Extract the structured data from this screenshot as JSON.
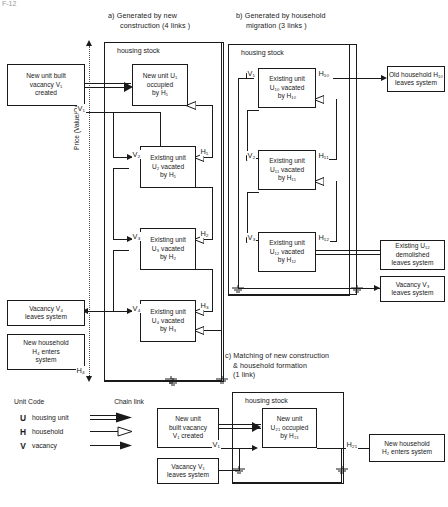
{
  "figure": {
    "corner_mark": "F-12",
    "axis_label": "Price (Value/Quality/ Scale )"
  },
  "panels": {
    "a": {
      "title_line1": "a) Generated by new",
      "title_line2": "construction (4 links )",
      "container_label": "housing stock",
      "boxes": [
        {
          "id": "a-new-unit-built",
          "lines": [
            "New unit built",
            "vacancy V₁",
            "created"
          ]
        },
        {
          "id": "a-u1",
          "lines": [
            "New unit U₁",
            "occupied",
            "by  H₁"
          ]
        },
        {
          "id": "a-u2",
          "lines": [
            "Existing unit",
            "U₂  vacated",
            "by   H₁"
          ]
        },
        {
          "id": "a-u3",
          "lines": [
            "Existing unit",
            "U₃ vacated",
            "by H₂"
          ]
        },
        {
          "id": "a-u4",
          "lines": [
            "Existing unit",
            "U₄ vacated",
            "by H₃"
          ]
        },
        {
          "id": "a-vacancy-leaves",
          "lines": [
            "Vacancy  V₄",
            "leaves  system"
          ]
        },
        {
          "id": "a-new-household",
          "lines": [
            "New household",
            "H₄ enters",
            "system"
          ]
        }
      ],
      "node_labels": [
        "V₁",
        "V₂",
        "V₃",
        "V₄",
        "H₁",
        "H₂",
        "H₃",
        "H₄"
      ]
    },
    "b": {
      "title_line1": "b) Generated by household",
      "title_line2": "migration (3 links )",
      "container_label": "housing stock",
      "boxes": [
        {
          "id": "b-u10",
          "lines": [
            "Existing unit",
            "U₁₀ vacated",
            "by  H₁₀"
          ]
        },
        {
          "id": "b-u11",
          "lines": [
            "Existing unit",
            "U₁₁ vacated",
            "by   H₁₁"
          ]
        },
        {
          "id": "b-u12",
          "lines": [
            "Existing unit",
            "U₁₂ vacated",
            "by H₁₂"
          ]
        },
        {
          "id": "b-old-household",
          "lines": [
            "Old household H₁₀",
            "leaves system"
          ]
        },
        {
          "id": "b-demolished",
          "lines": [
            "Existing   U₁₂",
            "demolished",
            "leaves system"
          ]
        },
        {
          "id": "b-vacancy-leaves",
          "lines": [
            "Vacancy V₃",
            "leaves system"
          ]
        }
      ],
      "node_labels": [
        "V₁",
        "V₂",
        "V₃",
        "H₁₀",
        "H₁₁",
        "H₁₂"
      ]
    },
    "c": {
      "title_line1": "c) Matching of new construction",
      "title_line2": "& household formation",
      "title_line3": "(1 link)",
      "container_label": "housing stock",
      "boxes": [
        {
          "id": "c-new-unit-built",
          "lines": [
            "New unit",
            "built  vacancy",
            "V₁  created"
          ]
        },
        {
          "id": "c-u21",
          "lines": [
            "New  unit",
            "U₂₁ occupied",
            "by H₂₁"
          ]
        },
        {
          "id": "c-vacancy-leaves",
          "lines": [
            "Vacancy  V₁",
            "leaves system"
          ]
        },
        {
          "id": "c-new-household",
          "lines": [
            "New household",
            "H₂ enters system"
          ]
        }
      ],
      "node_labels": [
        "V₁",
        "H₂₁"
      ]
    }
  },
  "legend": {
    "unit_code_header": "Unit Code",
    "chain_link_header": "Chain link",
    "rows": [
      {
        "code": "U",
        "label": "housing unit",
        "link": "double-line-arrow"
      },
      {
        "code": "H",
        "label": "household",
        "link": "hollow-arrow"
      },
      {
        "code": "V",
        "label": "vacancy",
        "link": "solid-arrow"
      }
    ]
  },
  "colors": {
    "stroke": "#1a1a1a",
    "background": "#ffffff",
    "dotted": "#555555"
  }
}
